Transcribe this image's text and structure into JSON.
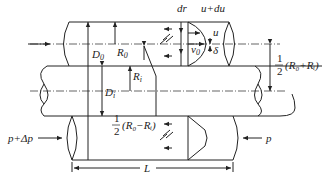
{
  "diagram": {
    "type": "annular-pipe-flow-schematic",
    "labels": {
      "dr": "dr",
      "u_du": "u+du",
      "u": "u",
      "v0": "v",
      "v0_sub": "0",
      "delta": "δ",
      "D0": "D",
      "D0_sub": "0",
      "R0": "R",
      "R0_sub": "0",
      "Ri": "R",
      "Ri_sub": "i",
      "Di": "D",
      "Di_sub": "i",
      "half_sum_num": "1",
      "half_sum_den": "2",
      "half_sum_expr": "(R₀+Rᵢ)",
      "half_diff_num": "1",
      "half_diff_den": "2",
      "half_diff_expr": "(R₀−Rᵢ)",
      "p_left": "p+Δp",
      "p_right": "p",
      "L": "L",
      "tau_top": "τ",
      "tau_bottom": "τ"
    },
    "colors": {
      "stroke": "#222222",
      "background": "#ffffff"
    }
  }
}
